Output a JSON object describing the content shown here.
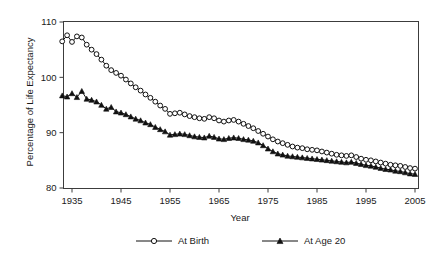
{
  "chart_data": {
    "type": "line",
    "title": "",
    "subtitle": "",
    "xlabel": "Year",
    "ylabel": "Percentage of Life Expectancy",
    "xlim": [
      1933,
      2006
    ],
    "ylim": [
      78,
      112
    ],
    "xticks": [
      1935,
      1945,
      1955,
      1965,
      1975,
      1985,
      1995,
      2005
    ],
    "yticks": [
      80,
      90,
      100,
      110
    ],
    "grid": false,
    "legend_position": "below",
    "series": [
      {
        "name": "At Birth",
        "marker": "open-circle",
        "x": [
          1933,
          1934,
          1935,
          1936,
          1937,
          1938,
          1939,
          1940,
          1941,
          1942,
          1943,
          1944,
          1945,
          1946,
          1947,
          1948,
          1949,
          1950,
          1951,
          1952,
          1953,
          1954,
          1955,
          1956,
          1957,
          1958,
          1959,
          1960,
          1961,
          1962,
          1963,
          1964,
          1965,
          1966,
          1967,
          1968,
          1969,
          1970,
          1971,
          1972,
          1973,
          1974,
          1975,
          1976,
          1977,
          1978,
          1979,
          1980,
          1981,
          1982,
          1983,
          1984,
          1985,
          1986,
          1987,
          1988,
          1989,
          1990,
          1991,
          1992,
          1993,
          1994,
          1995,
          1996,
          1997,
          1998,
          1999,
          2000,
          2001,
          2002,
          2003,
          2004,
          2005
        ],
        "values": [
          106.5,
          107.6,
          106.4,
          107.4,
          107.2,
          105.9,
          105.0,
          104.2,
          103.2,
          102.1,
          101.3,
          100.8,
          100.3,
          99.6,
          98.9,
          98.2,
          97.6,
          96.9,
          96.3,
          95.6,
          94.9,
          94.3,
          93.4,
          93.5,
          93.6,
          93.3,
          93.0,
          92.8,
          92.6,
          92.5,
          92.8,
          92.6,
          92.2,
          92.0,
          92.2,
          92.3,
          92.0,
          91.6,
          91.2,
          90.8,
          90.3,
          89.8,
          89.3,
          88.8,
          88.4,
          88.1,
          87.8,
          87.5,
          87.3,
          87.2,
          87.0,
          86.9,
          86.8,
          86.6,
          86.4,
          86.2,
          86.0,
          85.9,
          85.8,
          85.9,
          85.6,
          85.3,
          85.1,
          85.0,
          84.8,
          84.6,
          84.4,
          84.2,
          84.1,
          84.0,
          83.8,
          83.6,
          83.5
        ]
      },
      {
        "name": "At Age 20",
        "marker": "filled-triangle",
        "x": [
          1933,
          1934,
          1935,
          1936,
          1937,
          1938,
          1939,
          1940,
          1941,
          1942,
          1943,
          1944,
          1945,
          1946,
          1947,
          1948,
          1949,
          1950,
          1951,
          1952,
          1953,
          1954,
          1955,
          1956,
          1957,
          1958,
          1959,
          1960,
          1961,
          1962,
          1963,
          1964,
          1965,
          1966,
          1967,
          1968,
          1969,
          1970,
          1971,
          1972,
          1973,
          1974,
          1975,
          1976,
          1977,
          1978,
          1979,
          1980,
          1981,
          1982,
          1983,
          1984,
          1985,
          1986,
          1987,
          1988,
          1989,
          1990,
          1991,
          1992,
          1993,
          1994,
          1995,
          1996,
          1997,
          1998,
          1999,
          2000,
          2001,
          2002,
          2003,
          2004,
          2005
        ],
        "values": [
          96.7,
          96.5,
          97.1,
          96.4,
          97.5,
          96.1,
          95.9,
          95.6,
          95.0,
          94.3,
          94.6,
          93.8,
          93.6,
          93.3,
          92.9,
          92.5,
          92.2,
          91.8,
          91.5,
          91.0,
          90.6,
          90.2,
          89.6,
          89.7,
          89.8,
          89.7,
          89.5,
          89.3,
          89.2,
          89.1,
          89.4,
          89.2,
          88.9,
          88.8,
          89.0,
          89.1,
          89.0,
          88.8,
          88.7,
          88.5,
          88.2,
          87.7,
          87.1,
          86.6,
          86.2,
          86.0,
          85.8,
          85.7,
          85.6,
          85.5,
          85.4,
          85.3,
          85.2,
          85.1,
          85.0,
          84.9,
          84.8,
          84.7,
          84.6,
          84.7,
          84.5,
          84.3,
          84.1,
          84.0,
          83.8,
          83.6,
          83.4,
          83.3,
          83.1,
          83.0,
          82.8,
          82.6,
          82.5
        ]
      }
    ]
  },
  "legend": {
    "items": [
      {
        "label": "At Birth",
        "marker": "open-circle"
      },
      {
        "label": "At Age 20",
        "marker": "filled-triangle"
      }
    ]
  }
}
